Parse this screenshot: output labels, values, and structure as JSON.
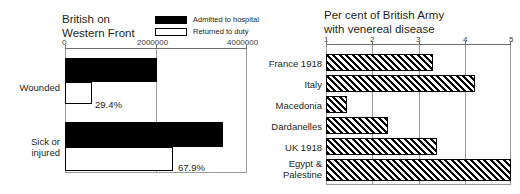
{
  "chart_data": [
    {
      "type": "bar",
      "orientation": "horizontal",
      "title": "British on Western Front",
      "title_lines": [
        "British on",
        "Western Front"
      ],
      "xlabel": "",
      "ylabel": "",
      "xlim": [
        0,
        4000000
      ],
      "xticks": [
        0,
        2000000,
        4000000
      ],
      "xtick_labels": [
        "0",
        "2000000",
        "4000000"
      ],
      "grid": true,
      "legend_position": "top-right",
      "categories": [
        "Wounded",
        "Sick or injured"
      ],
      "category_lines": [
        [
          "Wounded"
        ],
        [
          "Sick or",
          "injured"
        ]
      ],
      "series": [
        {
          "name": "Admitted to hospital",
          "values": [
            2000000,
            3490000
          ],
          "style": "solid-black"
        },
        {
          "name": "Returned to duty",
          "values": [
            588000,
            2369710
          ],
          "style": "hollow-white"
        }
      ],
      "data_labels": [
        "29.4%",
        "67.9%"
      ]
    },
    {
      "type": "bar",
      "orientation": "horizontal",
      "title": "Per cent of British Army with venereal disease",
      "title_lines": [
        "Per cent of British Army",
        "with venereal disease"
      ],
      "xlabel": "",
      "ylabel": "",
      "xlim": [
        1,
        5
      ],
      "xticks": [
        1,
        2,
        3,
        4,
        5
      ],
      "xtick_labels": [
        "1",
        "2",
        "3",
        "4",
        "5"
      ],
      "grid": true,
      "bar_style": "diagonal-hatch",
      "categories": [
        "France 1918",
        "Italy",
        "Macedonia",
        "Dardanelles",
        "UK 1918",
        "Egypt & Palestine"
      ],
      "category_lines": [
        [
          "France 1918"
        ],
        [
          "Italy"
        ],
        [
          "Macedonia"
        ],
        [
          "Dardanelles"
        ],
        [
          "UK 1918"
        ],
        [
          "Egypt &",
          "Palestine"
        ]
      ],
      "values": [
        3.3,
        4.2,
        1.45,
        2.35,
        3.4,
        5.0
      ]
    }
  ],
  "left": {
    "title_line1": "British on",
    "title_line2": "Western Front",
    "legend": [
      {
        "label": "Admitted to hospital",
        "swatch": "filled"
      },
      {
        "label": "Returned to duty",
        "swatch": "hollow"
      }
    ],
    "xtick_labels": [
      "0",
      "2000000",
      "4000000"
    ],
    "rows": [
      {
        "label_line1": "Wounded",
        "label_line2": "",
        "pct": "29.4%"
      },
      {
        "label_line1": "Sick or",
        "label_line2": "injured",
        "pct": "67.9%"
      }
    ]
  },
  "right": {
    "title_line1": "Per cent of British Army",
    "title_line2": "with venereal disease",
    "xtick_labels": [
      "1",
      "2",
      "3",
      "4",
      "5"
    ],
    "rows": [
      {
        "label_line1": "France 1918",
        "label_line2": ""
      },
      {
        "label_line1": "Italy",
        "label_line2": ""
      },
      {
        "label_line1": "Macedonia",
        "label_line2": ""
      },
      {
        "label_line1": "Dardanelles",
        "label_line2": ""
      },
      {
        "label_line1": "UK 1918",
        "label_line2": ""
      },
      {
        "label_line1": "Egypt &",
        "label_line2": "Palestine"
      }
    ]
  },
  "colors": {
    "bar_solid": "#000000",
    "bar_hollow": "#ffffff",
    "axis": "#6d6d6d",
    "grid": "#9a9a9a",
    "text": "#231f20",
    "background": "#ffffff"
  }
}
